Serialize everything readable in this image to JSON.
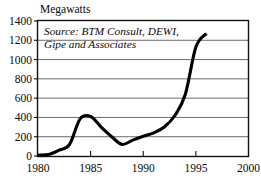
{
  "chart_data": {
    "type": "line",
    "title": "Megawatts",
    "xlabel": "",
    "ylabel": "Megawatts",
    "xlim": [
      1980,
      2000
    ],
    "ylim": [
      0,
      1400
    ],
    "grid": true,
    "legend": "none",
    "annotation": {
      "line1": "Source: BTM Consult, DEWI,",
      "line2": "Gipe and Associates"
    },
    "xticks": [
      1980,
      1985,
      1990,
      1995,
      2000
    ],
    "xtick_labels": [
      "1980",
      "1985",
      "1990",
      "1995",
      "2000"
    ],
    "yticks": [
      0,
      200,
      400,
      600,
      800,
      1000,
      1200,
      1400
    ],
    "ytick_labels": [
      "0",
      "200",
      "400",
      "600",
      "800",
      "1000",
      "1200",
      "1400"
    ],
    "series": [
      {
        "name": "Annual wind capacity installed",
        "x": [
          1980,
          1981,
          1982,
          1983,
          1984,
          1985,
          1986,
          1987,
          1988,
          1989,
          1990,
          1991,
          1992,
          1993,
          1994,
          1995,
          1996
        ],
        "values": [
          10,
          15,
          60,
          120,
          385,
          410,
          300,
          200,
          120,
          165,
          205,
          240,
          300,
          420,
          640,
          1130,
          1270
        ]
      }
    ]
  },
  "colors": {
    "series": "#000000",
    "grid": "#5a5a5a",
    "frame": "#111111",
    "text": "#0a0a0a",
    "background": "#ffffff"
  }
}
